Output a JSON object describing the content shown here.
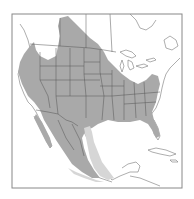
{
  "map": {
    "type": "species-range-map",
    "region": "North America (United States, southern Canada, Mexico, Caribbean)",
    "colors": {
      "background": "#ffffff",
      "frame": "#888888",
      "range_primary": "#a9a9a9",
      "range_secondary": "#d6d6d6",
      "boundaries": "#555555",
      "coastline": "#777777"
    },
    "legend": [
      {
        "name": "primary-range",
        "fill": "#a9a9a9"
      },
      {
        "name": "secondary-range-band",
        "fill": "#d6d6d6"
      }
    ],
    "labels": []
  }
}
